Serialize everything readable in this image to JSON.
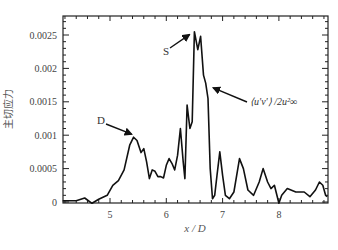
{
  "chart_data": {
    "type": "line",
    "title": "",
    "xlabel": "x / D",
    "ylabel": "主切应力",
    "xlim": [
      4.16,
      8.86
    ],
    "ylim": [
      -2e-05,
      0.0028
    ],
    "xticks": [
      5,
      6,
      7,
      8
    ],
    "xtick_labels": [
      "5",
      "6",
      "7",
      "8"
    ],
    "yticks": [
      0,
      0.0005,
      0.001,
      0.0015,
      0.002,
      0.0025
    ],
    "ytick_labels": [
      "0",
      "0.0005",
      "0.001",
      "0.0015",
      "0.002",
      "0.0025"
    ],
    "grid": false,
    "legend": null,
    "series": [
      {
        "name": "<u'v'>/2u∞²",
        "color": "#111111",
        "x": [
          4.16,
          4.4,
          4.55,
          4.68,
          4.8,
          4.95,
          5.05,
          5.15,
          5.25,
          5.35,
          5.42,
          5.48,
          5.55,
          5.6,
          5.65,
          5.7,
          5.75,
          5.8,
          5.85,
          5.9,
          5.95,
          6.0,
          6.05,
          6.1,
          6.15,
          6.2,
          6.25,
          6.3,
          6.33,
          6.37,
          6.42,
          6.46,
          6.5,
          6.56,
          6.61,
          6.66,
          6.7,
          6.74,
          6.78,
          6.82,
          6.86,
          6.9,
          6.95,
          7.0,
          7.05,
          7.12,
          7.2,
          7.3,
          7.37,
          7.45,
          7.55,
          7.65,
          7.72,
          7.8,
          7.86,
          7.92,
          8.0,
          8.05,
          8.15,
          8.3,
          8.45,
          8.55,
          8.65,
          8.72,
          8.78,
          8.83,
          8.86
        ],
        "y": [
          2e-05,
          2e-05,
          6e-05,
          -2e-05,
          4e-05,
          0.0001,
          0.00025,
          0.00032,
          0.00048,
          0.00085,
          0.00097,
          0.00092,
          0.00074,
          0.0008,
          0.0006,
          0.00035,
          0.00048,
          0.00046,
          0.00038,
          0.00038,
          0.00036,
          0.00055,
          0.00065,
          0.00058,
          0.00048,
          0.0007,
          0.0011,
          0.0006,
          0.00035,
          0.00145,
          0.0011,
          0.0012,
          0.00255,
          0.00228,
          0.00248,
          0.0019,
          0.00178,
          0.00155,
          0.0005,
          5e-05,
          0.0001,
          0.0004,
          0.00075,
          0.0004,
          0.0001,
          5e-05,
          0.00015,
          0.00065,
          0.0005,
          0.00018,
          0.0001,
          0.0003,
          0.0005,
          0.0003,
          0.0002,
          0.00025,
          -2e-05,
          0.0001,
          0.0002,
          0.00015,
          0.00015,
          8e-05,
          0.00018,
          0.0003,
          0.00025,
          0.0001,
          8e-05
        ]
      }
    ],
    "annotations": [
      {
        "text": "D",
        "target_x": 5.42,
        "target_y": 0.00097
      },
      {
        "text": "S",
        "target_x": 6.5,
        "target_y": 0.00255
      },
      {
        "text": "⟨u'v'⟩ /2u²∞",
        "target_x": 6.78,
        "target_y": 0.00168
      }
    ]
  }
}
